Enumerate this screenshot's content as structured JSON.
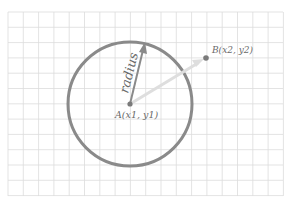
{
  "diagram": {
    "grid": {
      "x0": 8,
      "y0": 12,
      "x1": 283,
      "y1": 196,
      "step": 15.3,
      "color": "#dcdcdc"
    },
    "circle": {
      "cx": 130,
      "cy": 104,
      "r": 62,
      "color": "#8a8a8a"
    },
    "point_a": {
      "label": "A(x1, y1)",
      "x": 130,
      "y": 104,
      "color": "#7a7a7a"
    },
    "point_b": {
      "label": "B(x2, y2)",
      "x": 206,
      "y": 58,
      "color": "#7a7a7a"
    },
    "radius_arrow": {
      "label": "radius",
      "color": "#8a8a8a"
    },
    "distance_arrow": {
      "color": "#dedede"
    }
  }
}
